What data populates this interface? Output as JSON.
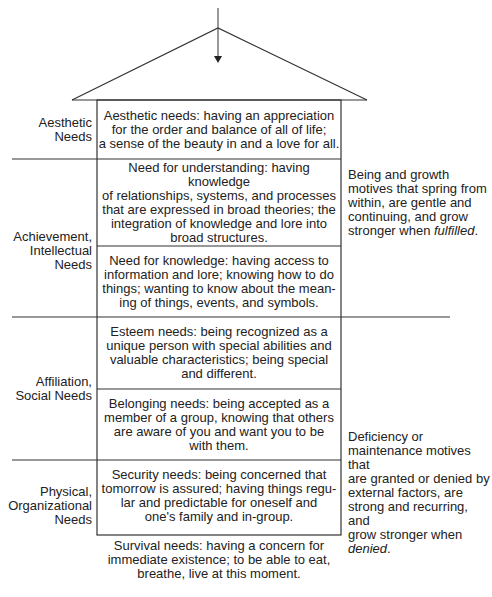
{
  "roof": {
    "arrow": "down-arrow"
  },
  "groups": [
    {
      "label_lines": [
        "Aesthetic",
        "Needs"
      ]
    },
    {
      "label_lines": [
        "Achievement,",
        "Intellectual",
        "Needs"
      ]
    },
    {
      "label_lines": [
        "Affiliation,",
        "Social Needs"
      ]
    },
    {
      "label_lines": [
        "Physical,",
        "Organizational",
        "Needs"
      ]
    }
  ],
  "needs": [
    {
      "lines": [
        "Aesthetic needs: having an appreciation",
        "for the order and balance of all of life;",
        "a sense of the beauty in and a love for all."
      ]
    },
    {
      "lines": [
        "Need for understanding: having knowledge",
        "of relationships, systems, and processes",
        "that are expressed in broad theories; the",
        "integration of knowledge and lore into",
        "broad structures."
      ]
    },
    {
      "lines": [
        "Need for knowledge: having access to",
        "information and lore; knowing how to do",
        "things; wanting to know about the mean-",
        "ing of things, events, and symbols."
      ]
    },
    {
      "lines": [
        "Esteem needs: being recognized as a",
        "unique person with special abilities and",
        "valuable characteristics; being special",
        "and different."
      ]
    },
    {
      "lines": [
        "Belonging needs: being accepted as a",
        "member of a group, knowing that others",
        "are aware of you and want you to be",
        "with them."
      ]
    },
    {
      "lines": [
        "Security needs: being concerned that",
        "tomorrow is assured; having things regu-",
        "lar and predictable for oneself and",
        "one's family and in-group."
      ]
    },
    {
      "lines": [
        "Survival needs: having a concern for",
        "immediate existence; to be able to eat,",
        "breathe, live at this moment."
      ]
    }
  ],
  "motives": {
    "growth": {
      "lines": [
        "Being and growth",
        "motives that spring from",
        "within, are gentle and",
        "continuing, and grow"
      ],
      "last_prefix": "stronger when ",
      "last_emph": "fulfilled",
      "last_suffix": "."
    },
    "deficiency": {
      "lines": [
        "Deficiency or",
        "maintenance motives that",
        "are granted or denied by",
        "external factors, are",
        "strong and recurring, and",
        "grow stronger when"
      ],
      "last_prefix": "",
      "last_emph": "denied",
      "last_suffix": "."
    }
  }
}
